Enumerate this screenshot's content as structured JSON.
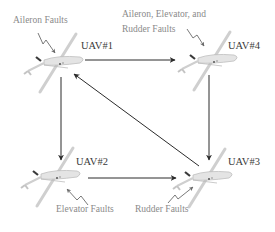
{
  "diagram": {
    "nodes": [
      {
        "id": "uav1",
        "label": "UAV#1",
        "fault": "Aileron Faults"
      },
      {
        "id": "uav2",
        "label": "UAV#2",
        "fault": "Elevator Faults"
      },
      {
        "id": "uav3",
        "label": "UAV#3",
        "fault": "Rudder Faults"
      },
      {
        "id": "uav4",
        "label": "UAV#4",
        "fault_line1": "Aileron, Elevator, and",
        "fault_line2": "Rudder Faults"
      }
    ],
    "edges": [
      {
        "from": "UAV#1",
        "to": "UAV#4"
      },
      {
        "from": "UAV#1",
        "to": "UAV#2"
      },
      {
        "from": "UAV#2",
        "to": "UAV#3"
      },
      {
        "from": "UAV#4",
        "to": "UAV#3"
      },
      {
        "from": "UAV#3",
        "to": "UAV#1"
      }
    ],
    "colors": {
      "arrow": "#2b2b2b",
      "uav_label": "#3a3a3a",
      "fault_label": "#8a8a8a",
      "fault_bolt": "#7a7a7a",
      "aircraft": "#c8c8c8"
    }
  }
}
